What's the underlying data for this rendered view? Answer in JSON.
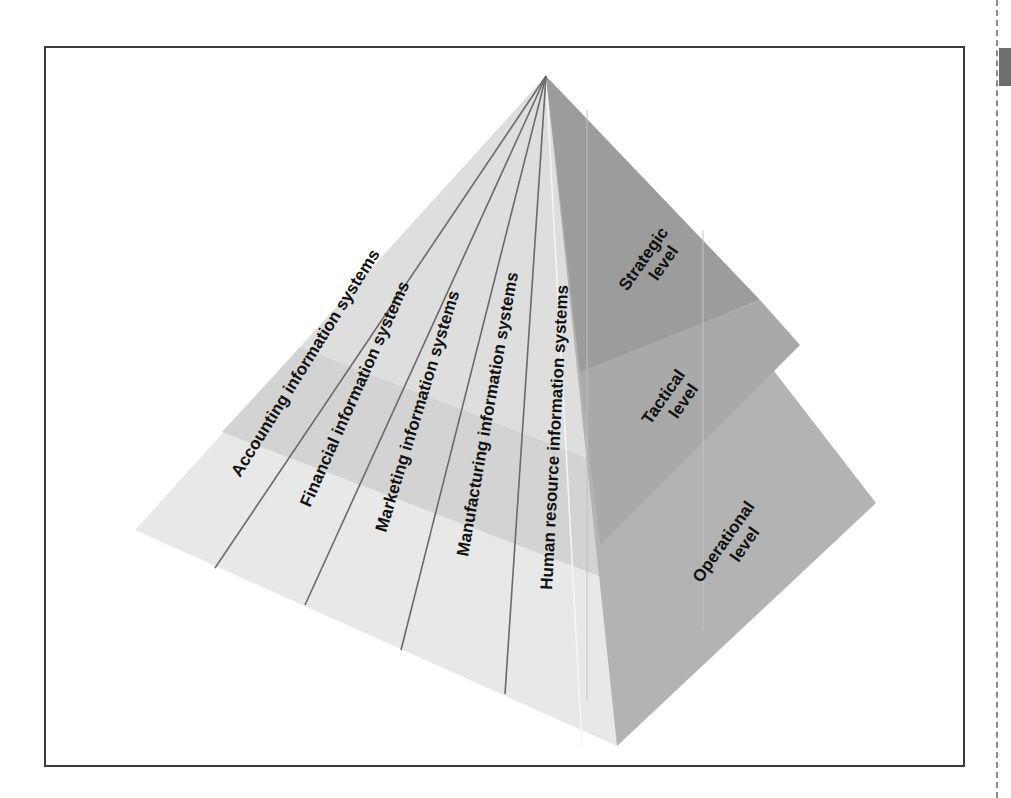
{
  "figure": {
    "type": "pyramid-diagram",
    "apex": [
      546,
      76
    ],
    "left_corner": [
      135,
      530
    ],
    "bottom_corner": [
      617,
      746
    ],
    "right_corner": [
      876,
      503
    ],
    "colors": {
      "left_face_light": "#e6e6e6",
      "left_face_band": "#d2d2d2",
      "left_face_top": "#dcdcdc",
      "right_face_top": "#9a9a9a",
      "right_face_mid": "#a8a8a8",
      "right_face_bottom": "#b2b2b2",
      "divider_line": "#6a6a6a",
      "text": "#111111",
      "frame": "#3a3a3a"
    }
  },
  "functional_systems": [
    {
      "label": "Accounting information systems"
    },
    {
      "label": "Financial information systems"
    },
    {
      "label": "Marketing information systems"
    },
    {
      "label": "Manufacturing information systems"
    },
    {
      "label": "Human resource information systems"
    }
  ],
  "levels": [
    {
      "line1": "Strategic",
      "line2": "level"
    },
    {
      "line1": "Tactical",
      "line2": "level"
    },
    {
      "line1": "Operational",
      "line2": "level"
    }
  ]
}
